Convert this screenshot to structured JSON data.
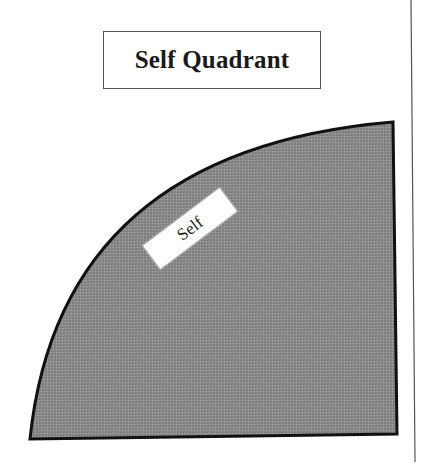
{
  "title": "Self Quadrant",
  "quadrant": {
    "label": "Self",
    "fill_color": "#8a8a8a",
    "stroke_color": "#111111"
  },
  "divider": {
    "color": "#555555"
  }
}
